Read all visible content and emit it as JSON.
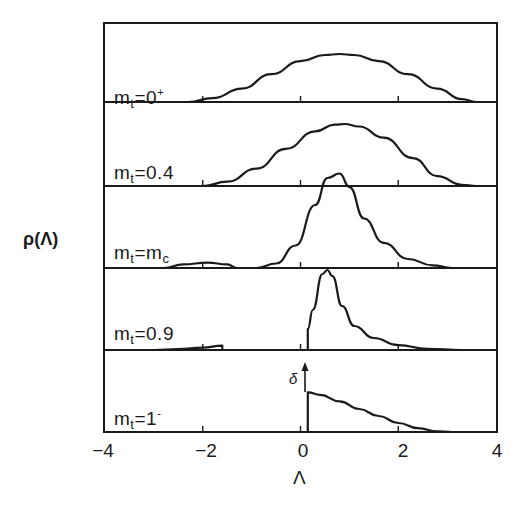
{
  "chart_data": {
    "type": "line",
    "title": "",
    "xlabel": "Λ",
    "ylabel": "ρ(Λ)",
    "xlim": [
      -4,
      4
    ],
    "x_ticks": [
      -4,
      -2,
      0,
      2,
      4
    ],
    "x_tick_labels": [
      "−4",
      "−2",
      "0",
      "2",
      "4"
    ],
    "grid": false,
    "layout": "stacked panels, one curve per m_t value, shared Λ axis",
    "annotations": [
      "δ ↑ (delta-function at Λ≈0.15 for m_t=1⁻)"
    ],
    "series": [
      {
        "name": "m_t=0⁺",
        "label_main": "m",
        "label_sub": "t",
        "label_rest": "=0",
        "label_sup": "+",
        "points": [
          [
            -2.3,
            0.0
          ],
          [
            -1.8,
            0.08
          ],
          [
            -1.2,
            0.28
          ],
          [
            -0.6,
            0.58
          ],
          [
            0.0,
            0.85
          ],
          [
            0.5,
            0.98
          ],
          [
            0.8,
            1.0
          ],
          [
            1.1,
            0.98
          ],
          [
            1.6,
            0.85
          ],
          [
            2.2,
            0.58
          ],
          [
            2.8,
            0.28
          ],
          [
            3.3,
            0.06
          ],
          [
            3.6,
            0.0
          ],
          [
            4.0,
            0.0
          ]
        ]
      },
      {
        "name": "m_t=0.4",
        "label_main": "m",
        "label_sub": "t",
        "label_rest": "=0.4",
        "label_sup": "",
        "points": [
          [
            -2.0,
            0.0
          ],
          [
            -1.5,
            0.07
          ],
          [
            -0.9,
            0.28
          ],
          [
            -0.3,
            0.6
          ],
          [
            0.3,
            0.88
          ],
          [
            0.7,
            0.99
          ],
          [
            0.9,
            1.0
          ],
          [
            1.2,
            0.96
          ],
          [
            1.7,
            0.78
          ],
          [
            2.3,
            0.45
          ],
          [
            2.8,
            0.16
          ],
          [
            3.3,
            0.02
          ],
          [
            3.6,
            0.0
          ],
          [
            4.0,
            0.0
          ]
        ]
      },
      {
        "name": "m_t=m_c",
        "label_main": "m",
        "label_sub": "t",
        "label_rest": "=m",
        "label_sub2": "c",
        "points": [
          [
            -2.8,
            0.0
          ],
          [
            -2.4,
            0.04
          ],
          [
            -1.9,
            0.06
          ],
          [
            -1.5,
            0.04
          ],
          [
            -1.3,
            0.0
          ],
          [
            -0.9,
            0.0
          ],
          [
            -0.5,
            0.05
          ],
          [
            -0.1,
            0.25
          ],
          [
            0.3,
            0.7
          ],
          [
            0.55,
            1.0
          ],
          [
            0.8,
            1.05
          ],
          [
            1.0,
            0.9
          ],
          [
            1.3,
            0.55
          ],
          [
            1.7,
            0.28
          ],
          [
            2.2,
            0.1
          ],
          [
            2.7,
            0.03
          ],
          [
            3.1,
            0.0
          ]
        ]
      },
      {
        "name": "m_t=0.9",
        "label_main": "m",
        "label_sub": "t",
        "label_rest": "=0.9",
        "label_sup": "",
        "points": [
          [
            -3.0,
            0.0
          ],
          [
            -2.5,
            0.02
          ],
          [
            -2.0,
            0.06
          ],
          [
            -1.6,
            0.11
          ],
          [
            -1.6,
            0.0
          ],
          [
            0.15,
            0.0
          ],
          [
            0.15,
            0.52
          ],
          [
            0.25,
            1.0
          ],
          [
            0.45,
            1.9
          ],
          [
            0.55,
            2.0
          ],
          [
            0.65,
            1.85
          ],
          [
            0.85,
            1.1
          ],
          [
            1.1,
            0.6
          ],
          [
            1.5,
            0.3
          ],
          [
            2.0,
            0.12
          ],
          [
            2.6,
            0.03
          ],
          [
            3.3,
            0.0
          ],
          [
            4.0,
            0.0
          ]
        ]
      },
      {
        "name": "m_t=1⁻",
        "label_main": "m",
        "label_sub": "t",
        "label_rest": "=1",
        "label_sup": "-",
        "points": [
          [
            0.15,
            0.0
          ],
          [
            0.15,
            0.62
          ],
          [
            0.4,
            0.58
          ],
          [
            0.8,
            0.48
          ],
          [
            1.2,
            0.36
          ],
          [
            1.6,
            0.25
          ],
          [
            2.0,
            0.14
          ],
          [
            2.4,
            0.06
          ],
          [
            2.8,
            0.01
          ],
          [
            3.1,
            0.0
          ]
        ]
      }
    ]
  },
  "labels": {
    "ylabel": "ρ(Λ)",
    "xlabel": "Λ",
    "delta": "δ",
    "panel_0": {
      "m": "m",
      "sub": "t",
      "rest": "=0",
      "sup": "+"
    },
    "panel_1": {
      "m": "m",
      "sub": "t",
      "rest": "=0.4",
      "sup": ""
    },
    "panel_2": {
      "m": "m",
      "sub": "t",
      "rest": "=m",
      "sub2": "c"
    },
    "panel_3": {
      "m": "m",
      "sub": "t",
      "rest": "=0.9",
      "sup": ""
    },
    "panel_4": {
      "m": "m",
      "sub": "t",
      "rest": "=1",
      "sup": "-"
    },
    "ticks": [
      "−4",
      "−2",
      "0",
      "2",
      "4"
    ]
  }
}
